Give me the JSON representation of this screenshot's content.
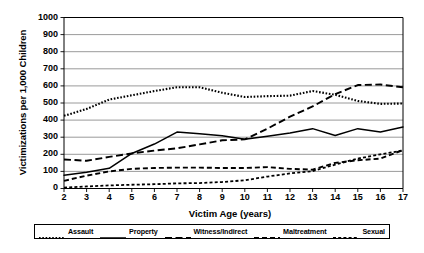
{
  "chart_data": {
    "type": "line",
    "title": "",
    "xlabel": "Victim Age (years)",
    "ylabel": "Victimizations per 1,000 Children",
    "xlim": [
      2,
      17
    ],
    "ylim": [
      0,
      1000
    ],
    "grid": true,
    "legend_position": "bottom",
    "xticks": [
      "2",
      "3",
      "4",
      "5",
      "6",
      "7",
      "8",
      "9",
      "10",
      "11",
      "12",
      "13",
      "14",
      "15",
      "16",
      "17"
    ],
    "yticks": [
      "0",
      "100",
      "200",
      "300",
      "400",
      "500",
      "600",
      "700",
      "800",
      "900",
      "1000"
    ],
    "x": [
      2,
      3,
      4,
      5,
      6,
      7,
      8,
      9,
      10,
      11,
      12,
      13,
      14,
      15,
      16,
      17
    ],
    "series": [
      {
        "name": "Assault",
        "dash": "dotted",
        "values": [
          425,
          465,
          520,
          545,
          570,
          592,
          592,
          560,
          535,
          540,
          543,
          570,
          548,
          512,
          495,
          497
        ]
      },
      {
        "name": "Property",
        "dash": "solid",
        "values": [
          78,
          95,
          118,
          205,
          260,
          330,
          320,
          308,
          288,
          305,
          325,
          350,
          310,
          350,
          330,
          360
        ]
      },
      {
        "name": "Witness/Indirect",
        "dash": "dashed-long",
        "values": [
          170,
          162,
          185,
          205,
          222,
          235,
          258,
          282,
          287,
          350,
          420,
          480,
          552,
          605,
          608,
          592
        ]
      },
      {
        "name": "Maltreatment",
        "dash": "dashed-medium",
        "values": [
          45,
          75,
          100,
          115,
          120,
          122,
          122,
          120,
          120,
          125,
          115,
          110,
          150,
          165,
          175,
          225
        ]
      },
      {
        "name": "Sexual",
        "dash": "dashed-short",
        "values": [
          5,
          12,
          18,
          22,
          25,
          30,
          32,
          38,
          48,
          70,
          88,
          102,
          140,
          175,
          200,
          222
        ]
      }
    ]
  },
  "legend": {
    "items": [
      {
        "label": "Assault",
        "icon": "dotted-line-swatch"
      },
      {
        "label": "Property",
        "icon": "solid-line-swatch"
      },
      {
        "label": "Witness/Indirect",
        "icon": "long-dash-line-swatch"
      },
      {
        "label": "Maltreatment",
        "icon": "medium-dash-line-swatch"
      },
      {
        "label": "Sexual",
        "icon": "short-dash-line-swatch"
      }
    ]
  },
  "colors": {
    "line": "#000000",
    "grid": "#808080",
    "axis": "#000000",
    "background": "#ffffff"
  }
}
